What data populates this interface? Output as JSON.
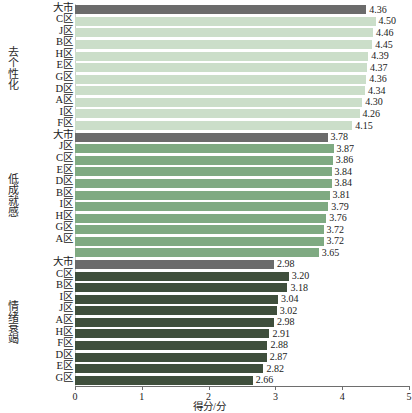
{
  "chart_data": {
    "type": "bar",
    "orientation": "horizontal",
    "title": "",
    "xlabel": "得分/分",
    "ylabel": "",
    "xlim": [
      0,
      5
    ],
    "xticks": [
      "0",
      "1",
      "2",
      "3",
      "4",
      "5"
    ],
    "grid": false,
    "legend": "none",
    "colors": {
      "city_total": "#6b6b6b",
      "group_depersonalization": "#cbdec9",
      "group_low_achievement": "#7faa82",
      "group_emotional_exhaustion": "#3f4f3c"
    },
    "groups": [
      {
        "name": "去个性化",
        "bar_color": "#cbdec9",
        "total_color": "#6b6b6b",
        "categories": [
          "大市",
          "C区",
          "J区",
          "B区",
          "H区",
          "E区",
          "G区",
          "D区",
          "A区",
          "I区",
          "F区"
        ],
        "values": [
          4.36,
          4.5,
          4.46,
          4.45,
          4.39,
          4.37,
          4.36,
          4.34,
          4.3,
          4.26,
          4.15
        ],
        "labels": [
          "4.36",
          "4.50",
          "4.46",
          "4.45",
          "4.39",
          "4.37",
          "4.36",
          "4.34",
          "4.30",
          "4.26",
          "4.15"
        ],
        "is_total": [
          true,
          false,
          false,
          false,
          false,
          false,
          false,
          false,
          false,
          false,
          false
        ]
      },
      {
        "name": "低成就感",
        "bar_color": "#7faa82",
        "total_color": "#6b6b6b",
        "categories": [
          "大市",
          "J区",
          "C区",
          "E区",
          "D区",
          "B区",
          "I区",
          "H区",
          "G区",
          "A区",
          ""
        ],
        "values": [
          3.78,
          3.87,
          3.86,
          3.84,
          3.84,
          3.81,
          3.79,
          3.76,
          3.72,
          3.72,
          3.65
        ],
        "labels": [
          "3.78",
          "3.87",
          "3.86",
          "3.84",
          "3.84",
          "3.81",
          "3.79",
          "3.76",
          "3.72",
          "3.72",
          "3.65"
        ],
        "is_total": [
          true,
          false,
          false,
          false,
          false,
          false,
          false,
          false,
          false,
          false,
          false
        ]
      },
      {
        "name": "情绪衰竭",
        "bar_color": "#3f4f3c",
        "total_color": "#6b6b6b",
        "categories": [
          "大市",
          "C区",
          "B区",
          "I区",
          "J区",
          "A区",
          "H区",
          "F区",
          "D区",
          "E区",
          "G区"
        ],
        "values": [
          2.98,
          3.2,
          3.18,
          3.04,
          3.02,
          2.98,
          2.91,
          2.88,
          2.87,
          2.82,
          2.66
        ],
        "labels": [
          "2.98",
          "3.20",
          "3.18",
          "3.04",
          "3.02",
          "2.98",
          "2.91",
          "2.88",
          "2.87",
          "2.82",
          "2.66"
        ],
        "is_total": [
          true,
          false,
          false,
          false,
          false,
          false,
          false,
          false,
          false,
          false,
          false
        ]
      }
    ]
  }
}
